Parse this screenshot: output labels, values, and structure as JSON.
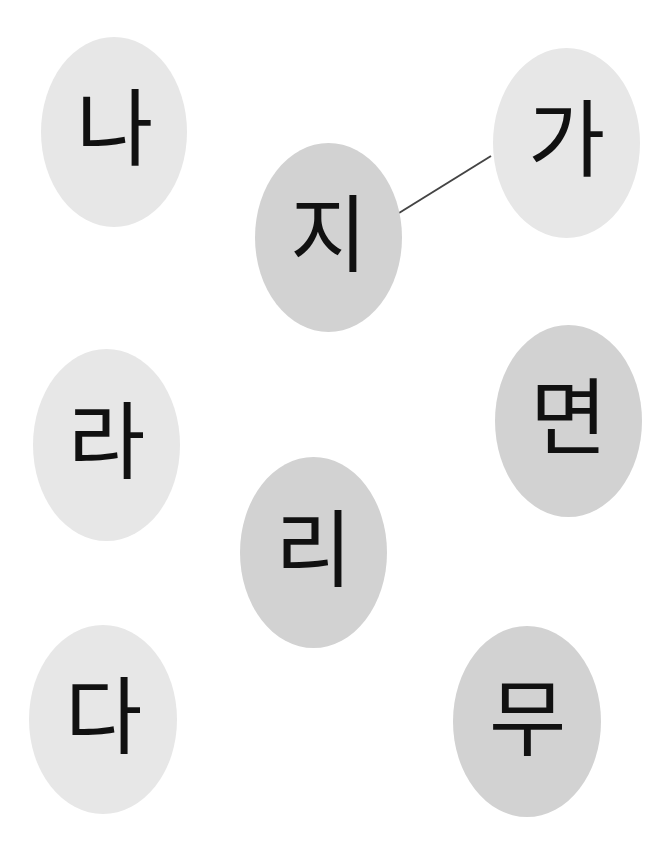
{
  "colors": {
    "light_fill": "#e7e7e7",
    "dark_fill": "#d2d2d2",
    "line": "#444444",
    "text": "#111111"
  },
  "bubbles": [
    {
      "id": "na",
      "label": "나",
      "x": 41,
      "y": 37,
      "w": 146,
      "h": 190,
      "tone": "light"
    },
    {
      "id": "ji",
      "label": "지",
      "x": 255,
      "y": 143,
      "w": 147,
      "h": 189,
      "tone": "dark"
    },
    {
      "id": "ga",
      "label": "가",
      "x": 493,
      "y": 48,
      "w": 147,
      "h": 190,
      "tone": "light"
    },
    {
      "id": "ra",
      "label": "라",
      "x": 33,
      "y": 349,
      "w": 147,
      "h": 192,
      "tone": "light"
    },
    {
      "id": "myeon",
      "label": "면",
      "x": 495,
      "y": 325,
      "w": 147,
      "h": 192,
      "tone": "dark"
    },
    {
      "id": "ri",
      "label": "리",
      "x": 240,
      "y": 457,
      "w": 147,
      "h": 191,
      "tone": "dark"
    },
    {
      "id": "da",
      "label": "다",
      "x": 29,
      "y": 625,
      "w": 148,
      "h": 189,
      "tone": "light"
    },
    {
      "id": "mu",
      "label": "무",
      "x": 453,
      "y": 626,
      "w": 148,
      "h": 191,
      "tone": "dark"
    }
  ],
  "connections": [
    {
      "from": "ji",
      "to": "ga",
      "x1": 399,
      "y1": 213,
      "x2": 491,
      "y2": 156
    }
  ]
}
